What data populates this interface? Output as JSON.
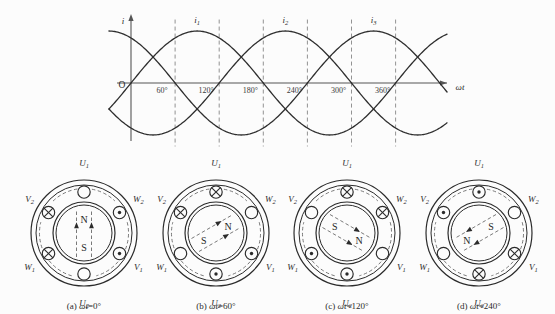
{
  "figure": {
    "title_absent": true,
    "background_color": "#fcfcfc",
    "ink_color": "#2b2b2b"
  },
  "chart_data": {
    "type": "line",
    "title": "",
    "xlabel": "ωt",
    "ylabel": "i",
    "origin_label": "O",
    "grid": true,
    "grid_orientation": "vertical-dashed",
    "xlim": [
      -30,
      430
    ],
    "ylim": [
      -1.15,
      1.15
    ],
    "xtick_labels": [
      "60°",
      "120°",
      "180°",
      "240°",
      "300°",
      "360°"
    ],
    "xticks": [
      60,
      120,
      180,
      240,
      300,
      360
    ],
    "legend_position": "above-peaks",
    "series": [
      {
        "name": "i₁",
        "label": "i",
        "label_sub": "1",
        "phase_deg": 0,
        "amplitude": 1,
        "peak_at_deg": 90
      },
      {
        "name": "i₂",
        "label": "i",
        "label_sub": "2",
        "phase_deg": -120,
        "amplitude": 1,
        "peak_at_deg": 210
      },
      {
        "name": "i₃",
        "label": "i",
        "label_sub": "3",
        "phase_deg": -240,
        "amplitude": 1,
        "peak_at_deg": 330
      }
    ],
    "annotations": [
      {
        "text": "i",
        "sub": "1",
        "at_deg": 90
      },
      {
        "text": "i",
        "sub": "2",
        "at_deg": 210
      },
      {
        "text": "i",
        "sub": "3",
        "at_deg": 330
      }
    ]
  },
  "motor_diagrams": [
    {
      "id": "a",
      "caption_prefix": "(a)",
      "caption_var": "ωt",
      "caption_value": "=0°",
      "rotor_angle_deg": 0,
      "pole_top": "N",
      "pole_bottom": "S",
      "field_axis": "vertical",
      "slots": [
        {
          "label": "U",
          "sub": "1",
          "position": "top",
          "mark": "circle"
        },
        {
          "label": "W",
          "sub": "2",
          "position": "upper-right",
          "mark": "dot"
        },
        {
          "label": "V",
          "sub": "1",
          "position": "lower-right",
          "mark": "dot"
        },
        {
          "label": "U",
          "sub": "2",
          "position": "bottom",
          "mark": "circle"
        },
        {
          "label": "W",
          "sub": "1",
          "position": "lower-left",
          "mark": "cross"
        },
        {
          "label": "V",
          "sub": "2",
          "position": "upper-left",
          "mark": "cross"
        }
      ]
    },
    {
      "id": "b",
      "caption_prefix": "(b)",
      "caption_var": "ωt",
      "caption_value": "=60°",
      "rotor_angle_deg": 60,
      "pole_top": "N",
      "pole_bottom": "S",
      "field_axis": "tilted",
      "slots": [
        {
          "label": "U",
          "sub": "1",
          "position": "top",
          "mark": "cross"
        },
        {
          "label": "W",
          "sub": "2",
          "position": "upper-right",
          "mark": "circle"
        },
        {
          "label": "V",
          "sub": "1",
          "position": "lower-right",
          "mark": "dot"
        },
        {
          "label": "U",
          "sub": "2",
          "position": "bottom",
          "mark": "dot"
        },
        {
          "label": "W",
          "sub": "1",
          "position": "lower-left",
          "mark": "circle"
        },
        {
          "label": "V",
          "sub": "2",
          "position": "upper-left",
          "mark": "cross"
        }
      ]
    },
    {
      "id": "c",
      "caption_prefix": "(c)",
      "caption_var": "ωt",
      "caption_value": "=120°",
      "rotor_angle_deg": 120,
      "pole_top": "S",
      "pole_bottom": "N",
      "field_axis": "tilted",
      "slots": [
        {
          "label": "U",
          "sub": "1",
          "position": "top",
          "mark": "cross"
        },
        {
          "label": "W",
          "sub": "2",
          "position": "upper-right",
          "mark": "cross"
        },
        {
          "label": "V",
          "sub": "1",
          "position": "lower-right",
          "mark": "circle"
        },
        {
          "label": "U",
          "sub": "2",
          "position": "bottom",
          "mark": "dot"
        },
        {
          "label": "W",
          "sub": "1",
          "position": "lower-left",
          "mark": "dot"
        },
        {
          "label": "V",
          "sub": "2",
          "position": "upper-left",
          "mark": "circle"
        }
      ]
    },
    {
      "id": "d",
      "caption_prefix": "(d)",
      "caption_var": "ωt",
      "caption_value": "=240°",
      "rotor_angle_deg": 240,
      "pole_top": "S",
      "pole_bottom": "N",
      "field_axis": "tilted",
      "slots": [
        {
          "label": "U",
          "sub": "1",
          "position": "top",
          "mark": "dot"
        },
        {
          "label": "W",
          "sub": "2",
          "position": "upper-right",
          "mark": "circle"
        },
        {
          "label": "V",
          "sub": "1",
          "position": "lower-right",
          "mark": "cross"
        },
        {
          "label": "U",
          "sub": "2",
          "position": "bottom",
          "mark": "cross"
        },
        {
          "label": "W",
          "sub": "1",
          "position": "lower-left",
          "mark": "circle"
        },
        {
          "label": "V",
          "sub": "2",
          "position": "upper-left",
          "mark": "dot"
        }
      ]
    }
  ]
}
